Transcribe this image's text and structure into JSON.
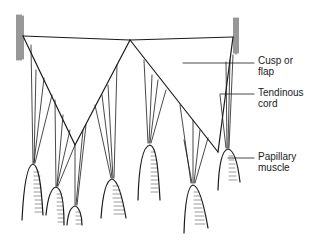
{
  "diagram": {
    "labels": {
      "cusp": {
        "line1": "Cusp or",
        "line2": "flap"
      },
      "tendinous_cord": {
        "line1": "Tendinous",
        "line2": "cord"
      },
      "papillary_muscle": {
        "line1": "Papillary",
        "line2": "muscle"
      }
    },
    "colors": {
      "ink": "#1a1a1a",
      "background": "#ffffff"
    }
  }
}
